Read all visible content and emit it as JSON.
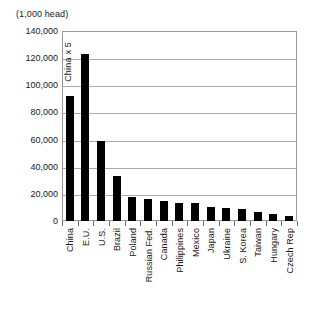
{
  "chart_data": {
    "type": "bar",
    "title": "(1,000 head)",
    "xlabel": "",
    "ylabel": "",
    "ylim": [
      0,
      140000
    ],
    "ytick_step": 20000,
    "grid": true,
    "legend": false,
    "bar_color": "#000000",
    "annotations": [
      {
        "text": "China x 5",
        "target_category": "China"
      }
    ],
    "ytick_labels": [
      "0",
      "20,000",
      "40,000",
      "60,000",
      "80,000",
      "100,000",
      "120,000",
      "140,000"
    ],
    "ytick_values": [
      0,
      20000,
      40000,
      60000,
      80000,
      100000,
      120000,
      140000
    ],
    "categories": [
      "China",
      "E.U.",
      "U.S.",
      "Brazil",
      "Poland",
      "Russian Fed.",
      "Canada",
      "Philippines",
      "Mexico",
      "Japan",
      "Ukraine",
      "S. Korea",
      "Taiwan",
      "Hungary",
      "Czech Rep"
    ],
    "values": [
      92000,
      123000,
      59000,
      33000,
      17500,
      16500,
      14500,
      13500,
      13000,
      10000,
      9500,
      9000,
      7000,
      5000,
      4000
    ]
  }
}
